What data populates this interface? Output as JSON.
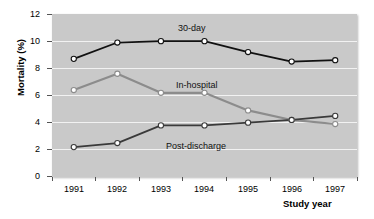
{
  "chart_data": {
    "type": "line",
    "title": "",
    "xlabel": "Study year",
    "ylabel": "Mortality (%)",
    "categories": [
      "1991",
      "1992",
      "1993",
      "1994",
      "1995",
      "1996",
      "1997"
    ],
    "x": [
      1991,
      1992,
      1993,
      1994,
      1995,
      1996,
      1997
    ],
    "ylim": [
      0,
      12
    ],
    "yticks": [
      0,
      2,
      4,
      6,
      8,
      10,
      12
    ],
    "grid": true,
    "legend_position": "inline-annotations",
    "plot_background": "#c9c9c9",
    "gridline_color": "#f2f2f2",
    "series": [
      {
        "name": "30-day",
        "color": "#111111",
        "marker": "open-circle",
        "values": [
          8.7,
          9.9,
          10.0,
          10.0,
          9.2,
          8.5,
          8.6
        ]
      },
      {
        "name": "In-hospital",
        "color": "#8c8c8c",
        "marker": "open-circle",
        "values": [
          6.4,
          7.6,
          6.2,
          6.2,
          4.9,
          4.2,
          3.9
        ]
      },
      {
        "name": "Post-discharge",
        "color": "#3a3a3a",
        "marker": "open-circle",
        "values": [
          2.2,
          2.5,
          3.8,
          3.8,
          4.0,
          4.2,
          4.5
        ]
      }
    ],
    "annotations": [
      {
        "text": "30-day",
        "x_px": 178,
        "y_px": 24
      },
      {
        "text": "In-hospital",
        "x_px": 176,
        "y_px": 81
      },
      {
        "text": "Post-discharge",
        "x_px": 166,
        "y_px": 142
      }
    ]
  },
  "axes": {
    "y_title": "Mortality (%)",
    "x_title": "Study year",
    "y_tick_labels": [
      "12",
      "10",
      "8",
      "6",
      "4",
      "2",
      "0"
    ],
    "x_tick_labels": [
      "1991",
      "1992",
      "1993",
      "1994",
      "1995",
      "1996",
      "1997"
    ]
  }
}
